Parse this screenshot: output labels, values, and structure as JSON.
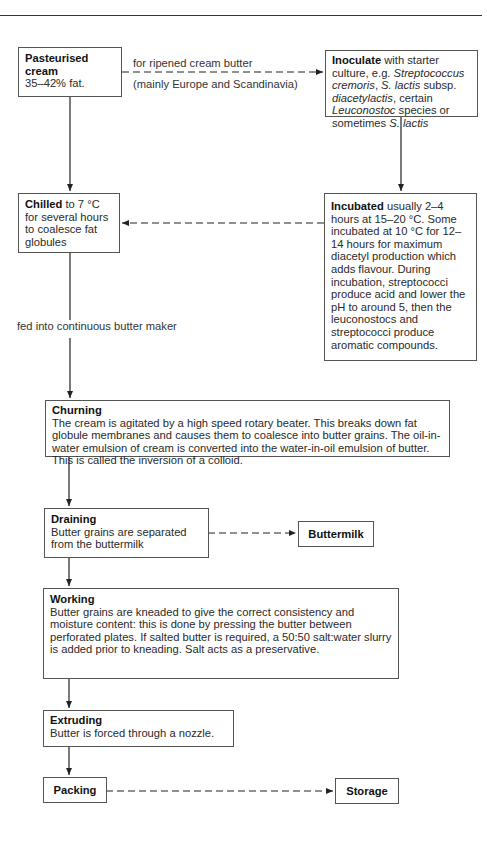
{
  "diagram": {
    "nodes": {
      "pasteurised": {
        "title": "Pasteurised cream",
        "title_line1": "Pasteurised",
        "title_line2": "cream",
        "text": "35–42% fat."
      },
      "inoculate": {
        "title": "Inoculate",
        "t1": " with starter culture, e.g. ",
        "i1": "Streptococcus cremoris",
        "t2": ", ",
        "i2": "S. lactis",
        "t3": " subsp. ",
        "i3": "diacetylactis",
        "t4": ", certain ",
        "i4": "Leuconostoc",
        "t5": " species or sometimes ",
        "i5": "S. lactis"
      },
      "chilled": {
        "title": "Chilled",
        "text": " to 7 °C for several hours to coalesce fat globules"
      },
      "incubated": {
        "title": "Incubated",
        "text": " usually 2–4 hours at 15–20 °C. Some incubated at 10 °C for 12–14 hours for maximum diacetyl production which adds flavour. During incubation, streptococci produce acid and lower the pH to around 5, then the leuconostocs and streptococci produce aromatic compounds."
      },
      "churning": {
        "title": "Churning",
        "text": "The cream is agitated by a high speed rotary beater. This breaks down fat globule membranes and causes them to coalesce into butter grains. The oil-in-water emulsion of cream is converted into the water-in-oil emulsion of butter. This is called the inversion of a colloid."
      },
      "draining": {
        "title": "Draining",
        "text": "Butter grains are separated from the buttermilk"
      },
      "buttermilk": {
        "title": "Buttermilk"
      },
      "working": {
        "title": "Working",
        "text": "Butter grains are kneaded to give the correct consistency and moisture content: this is done by pressing the butter between perforated plates. If salted butter is required, a 50:50 salt:water slurry is added prior to kneading. Salt acts as a preservative."
      },
      "extruding": {
        "title": "Extruding",
        "text": "Butter is forced through a nozzle."
      },
      "packing": {
        "title": "Packing"
      },
      "storage": {
        "title": "Storage"
      }
    },
    "edge_labels": {
      "ripened_top": "for ripened cream butter",
      "ripened_bottom": "(mainly Europe and Scandinavia)",
      "fed": "fed into continuous butter maker"
    },
    "edges": [
      {
        "from": "pasteurised",
        "to": "inoculate",
        "style": "dashed"
      },
      {
        "from": "pasteurised",
        "to": "chilled",
        "style": "solid"
      },
      {
        "from": "inoculate",
        "to": "incubated",
        "style": "solid"
      },
      {
        "from": "incubated",
        "to": "chilled",
        "style": "dashed"
      },
      {
        "from": "chilled",
        "to": "churning",
        "style": "solid"
      },
      {
        "from": "churning",
        "to": "draining",
        "style": "solid"
      },
      {
        "from": "draining",
        "to": "buttermilk",
        "style": "dashed"
      },
      {
        "from": "draining",
        "to": "working",
        "style": "solid"
      },
      {
        "from": "working",
        "to": "extruding",
        "style": "solid"
      },
      {
        "from": "extruding",
        "to": "packing",
        "style": "solid"
      },
      {
        "from": "packing",
        "to": "storage",
        "style": "dashed"
      }
    ]
  }
}
